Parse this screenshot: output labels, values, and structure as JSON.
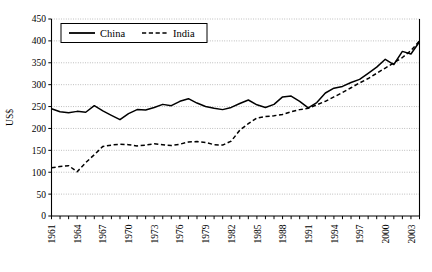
{
  "chart_data": {
    "type": "line",
    "title": "",
    "xlabel": "",
    "ylabel": "US$",
    "ylim": [
      0,
      450
    ],
    "ytick_step": 50,
    "yticks": [
      0,
      50,
      100,
      150,
      200,
      250,
      300,
      350,
      400,
      450
    ],
    "xlim": [
      1961,
      2004
    ],
    "xticks": [
      1961,
      1964,
      1967,
      1970,
      1973,
      1976,
      1979,
      1982,
      1985,
      1988,
      1991,
      1994,
      1997,
      2000,
      2003
    ],
    "grid": true,
    "grid_axis": "y",
    "legend_position": "top-left-inside",
    "x": [
      1961,
      1962,
      1963,
      1964,
      1965,
      1966,
      1967,
      1968,
      1969,
      1970,
      1971,
      1972,
      1973,
      1974,
      1975,
      1976,
      1977,
      1978,
      1979,
      1980,
      1981,
      1982,
      1983,
      1984,
      1985,
      1986,
      1987,
      1988,
      1989,
      1990,
      1991,
      1992,
      1993,
      1994,
      1995,
      1996,
      1997,
      1998,
      1999,
      2000,
      2001,
      2002,
      2003,
      2004
    ],
    "series": [
      {
        "name": "China",
        "style": "solid",
        "color": "#000000",
        "values": [
          245,
          238,
          236,
          239,
          237,
          252,
          240,
          230,
          220,
          234,
          243,
          242,
          248,
          255,
          252,
          262,
          268,
          258,
          250,
          246,
          243,
          248,
          257,
          265,
          254,
          248,
          255,
          272,
          274,
          262,
          247,
          259,
          281,
          292,
          296,
          305,
          312,
          326,
          340,
          358,
          346,
          376,
          370,
          398
        ]
      },
      {
        "name": "India",
        "style": "dashed",
        "color": "#000000",
        "values": [
          110,
          113,
          115,
          101,
          122,
          140,
          159,
          162,
          164,
          163,
          160,
          162,
          165,
          163,
          161,
          164,
          169,
          170,
          168,
          163,
          162,
          171,
          196,
          211,
          224,
          227,
          229,
          232,
          238,
          243,
          246,
          254,
          262,
          272,
          282,
          293,
          304,
          314,
          326,
          338,
          350,
          362,
          378,
          400
        ]
      }
    ]
  },
  "legend": {
    "entries": [
      {
        "label": "China",
        "style": "solid"
      },
      {
        "label": "India",
        "style": "dashed"
      }
    ]
  },
  "axes": {
    "y_title": "US$"
  }
}
